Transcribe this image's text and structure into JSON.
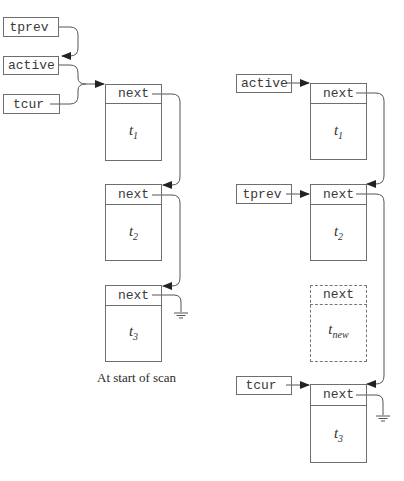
{
  "left_panel": {
    "pointers": {
      "tprev": "tprev",
      "active": "active",
      "tcur": "tcur"
    },
    "nodes": [
      {
        "field": "next",
        "label": "t",
        "sub": "1"
      },
      {
        "field": "next",
        "label": "t",
        "sub": "2"
      },
      {
        "field": "next",
        "label": "t",
        "sub": "3"
      }
    ],
    "caption": "At start of scan"
  },
  "right_panel": {
    "pointers": {
      "active": "active",
      "tprev": "tprev",
      "tcur": "tcur"
    },
    "nodes": [
      {
        "field": "next",
        "label": "t",
        "sub": "1"
      },
      {
        "field": "next",
        "label": "t",
        "sub": "2"
      },
      {
        "field": "next",
        "label": "t",
        "sub": "new",
        "dashed": true
      },
      {
        "field": "next",
        "label": "t",
        "sub": "3"
      }
    ]
  },
  "colors": {
    "line": "#555555",
    "box_border": "#6e6e6e"
  }
}
